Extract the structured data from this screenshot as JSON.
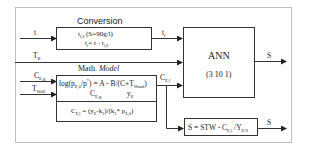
{
  "diagram": {
    "conversion": {
      "title": "Conversion",
      "line1_main": "t",
      "line1_sub": "l,0",
      "line1_rest": " (S=90g/l)",
      "line2_a": "t",
      "line2_a_sub": "r",
      "line2_b": "= t - t",
      "line2_b_sub": "l,0"
    },
    "math_model": {
      "title_plain": "Math. ",
      "title_italic": "Model",
      "eq1_a": "log(p",
      "eq1_a_sub": "E,0",
      "eq1_b": "/p",
      "eq1_b_sup": "*",
      "eq1_c": ") = A - B/(C+T",
      "eq1_c_sub": "Wand",
      "eq1_d": ")",
      "eq2_a": "C",
      "eq2_a_sub": "E,g",
      "eq2_b": "y",
      "eq2_b_sub": "E",
      "eq3_a": "C",
      "eq3_a_sub": "E,l",
      "eq3_b": " = (y",
      "eq3_b_sub": "E",
      "eq3_c": "-k",
      "eq3_c_sub": "1",
      "eq3_d": ")/(k",
      "eq3_d_sub": "2",
      "eq3_e": "* p",
      "eq3_e_sub": "E,0",
      "eq3_f": ")"
    },
    "ann": {
      "title": "ANN",
      "topology": "(3 10 1)"
    },
    "substrate": {
      "eq_a": "S = STW - C",
      "eq_a_sub": "E,l",
      "eq_b": " /Y",
      "eq_b_sub": "E/S"
    },
    "signals": {
      "t": "t",
      "tr_main": "t",
      "tr_sub": "r",
      "TB_main": "T",
      "TB_sub": "B",
      "CEg_main": "C",
      "CEg_sub": "E,g",
      "TWall_main": "T",
      "TWall_sub": "Wall",
      "CEl_main": "C",
      "CEl_sub": "E,l",
      "S_ann": "S",
      "S_bottom": "S"
    }
  }
}
